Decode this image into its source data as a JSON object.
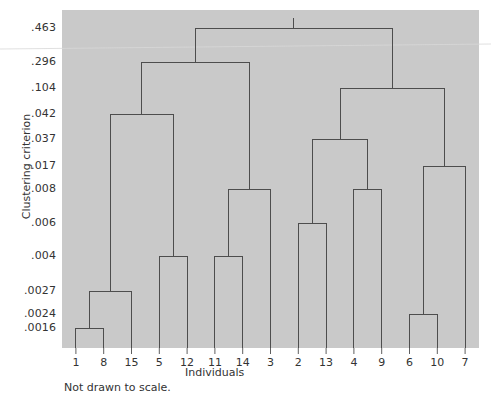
{
  "chart_data": {
    "type": "line",
    "title": "",
    "subtitle": "",
    "xlabel": "Individuals",
    "ylabel": "Clustering criterion",
    "caption": "Not drawn to scale.",
    "legend": [],
    "grid": false,
    "axis_note": "y-axis is non-linear / not drawn to scale; tick labels are merge-criterion values",
    "leaves": [
      "1",
      "8",
      "15",
      "5",
      "12",
      "11",
      "14",
      "3",
      "2",
      "13",
      "4",
      "9",
      "6",
      "10",
      "7"
    ],
    "xtick_labels": [
      "1",
      "8",
      "15",
      "5",
      "12",
      "11",
      "14",
      "3",
      "2",
      "13",
      "4",
      "9",
      "6",
      "10",
      "7"
    ],
    "ytick_labels": [
      ".463",
      ".296",
      ".104",
      ".042",
      ".037",
      ".017",
      ".008",
      ".006",
      ".004",
      ".0027",
      ".0024",
      ".0016"
    ],
    "ytick_values": [
      0.463,
      0.296,
      0.104,
      0.042,
      0.037,
      0.017,
      0.008,
      0.006,
      0.004,
      0.0027,
      0.0024,
      0.0016
    ],
    "ytick_pixels": [
      28,
      62,
      88,
      114,
      139,
      166,
      189,
      223,
      256,
      291,
      314,
      328
    ],
    "merges": [
      {
        "id": "m1",
        "label": ".0016",
        "height": 0.0016,
        "y": 328,
        "left": "1",
        "right": "8"
      },
      {
        "id": "m2",
        "label": ".0024",
        "height": 0.0024,
        "y": 314,
        "left": "6",
        "right": "10"
      },
      {
        "id": "m3",
        "label": ".0027",
        "height": 0.0027,
        "y": 291,
        "left": "m1",
        "right": "15"
      },
      {
        "id": "m4",
        "label": ".004",
        "height": 0.004,
        "y": 256,
        "left": "5",
        "right": "12"
      },
      {
        "id": "m5",
        "label": ".004",
        "height": 0.004,
        "y": 256,
        "left": "11",
        "right": "14"
      },
      {
        "id": "m6",
        "label": ".006",
        "height": 0.006,
        "y": 223,
        "left": "2",
        "right": "13"
      },
      {
        "id": "m7",
        "label": ".008",
        "height": 0.008,
        "y": 189,
        "left": "m5",
        "right": "3"
      },
      {
        "id": "m8",
        "label": ".008",
        "height": 0.008,
        "y": 189,
        "left": "4",
        "right": "9"
      },
      {
        "id": "m9",
        "label": ".017",
        "height": 0.017,
        "y": 166,
        "left": "m2",
        "right": "7"
      },
      {
        "id": "m10",
        "label": ".037",
        "height": 0.037,
        "y": 139,
        "left": "m6",
        "right": "m8"
      },
      {
        "id": "m11",
        "label": ".042",
        "height": 0.042,
        "y": 114,
        "left": "m3",
        "right": "m4"
      },
      {
        "id": "m12",
        "label": ".104",
        "height": 0.104,
        "y": 88,
        "left": "m10",
        "right": "m9"
      },
      {
        "id": "m13",
        "label": ".296",
        "height": 0.296,
        "y": 62,
        "left": "m11",
        "right": "m7"
      },
      {
        "id": "m14",
        "label": ".463",
        "height": 0.463,
        "y": 28,
        "left": "m13",
        "right": "m12"
      }
    ],
    "plot_area": {
      "x": 62,
      "y": 10,
      "width": 417,
      "height": 338
    },
    "colors": {
      "plot_background": "#c9c9c9",
      "line": "#4d4d4d",
      "text": "#333333",
      "page_background": "#ffffff"
    }
  }
}
